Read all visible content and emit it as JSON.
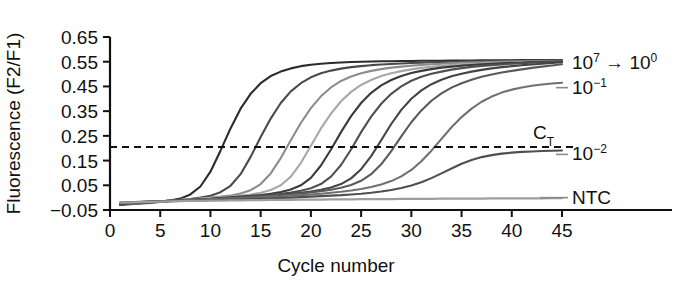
{
  "chart_data": {
    "type": "line",
    "title": "",
    "xlabel": "Cycle number",
    "ylabel": "Fluorescence (F2/F1)",
    "xlim": [
      0,
      45
    ],
    "ylim": [
      -0.05,
      0.65
    ],
    "grid": false,
    "legend_position": "right-inline",
    "x_ticks": [
      "0",
      "5",
      "10",
      "15",
      "20",
      "25",
      "30",
      "35",
      "40",
      "45"
    ],
    "x_tick_values": [
      0,
      5,
      10,
      15,
      20,
      25,
      30,
      35,
      40,
      45
    ],
    "y_ticks": [
      "0.65",
      "0.55",
      "0.45",
      "0.35",
      "0.25",
      "0.15",
      "0.05",
      "−0.05"
    ],
    "y_tick_values": [
      0.65,
      0.55,
      0.45,
      0.35,
      0.25,
      0.15,
      0.05,
      -0.05
    ],
    "threshold": {
      "label": "C",
      "label_sub": "T",
      "value": 0.205,
      "style": "dashed"
    },
    "annotations": [
      {
        "id": "dilution-range",
        "text": "10",
        "sup": "7",
        "arrow": "→",
        "text2": "10",
        "sup2": "0",
        "y": 0.545
      },
      {
        "id": "dilution-1e-1",
        "text": "10",
        "sup": "−1",
        "y": 0.445
      },
      {
        "id": "dilution-1e-2",
        "text": "10",
        "sup": "−2",
        "y": 0.175
      },
      {
        "id": "ntc",
        "text": "NTC",
        "y": 0.0
      }
    ],
    "x": [
      1,
      2,
      3,
      4,
      5,
      6,
      7,
      8,
      9,
      10,
      11,
      12,
      13,
      14,
      15,
      16,
      17,
      18,
      19,
      20,
      21,
      22,
      23,
      24,
      25,
      26,
      27,
      28,
      29,
      30,
      31,
      32,
      33,
      34,
      35,
      36,
      37,
      38,
      39,
      40,
      41,
      42,
      43,
      44,
      45
    ],
    "series": [
      {
        "name": "10^7",
        "color": "#2b2b2b",
        "ct": 10.0,
        "values": [
          -0.03,
          -0.027,
          -0.024,
          -0.021,
          -0.017,
          -0.012,
          -0.004,
          0.013,
          0.045,
          0.105,
          0.19,
          0.28,
          0.36,
          0.42,
          0.463,
          0.492,
          0.51,
          0.523,
          0.532,
          0.538,
          0.542,
          0.545,
          0.547,
          0.549,
          0.55,
          0.551,
          0.552,
          0.552,
          0.553,
          0.553,
          0.554,
          0.554,
          0.554,
          0.555,
          0.555,
          0.555,
          0.556,
          0.556,
          0.556,
          0.556,
          0.557,
          0.557,
          0.557,
          0.557,
          0.557
        ]
      },
      {
        "name": "10^6",
        "color": "#4a4a4a",
        "ct": 13.0,
        "values": [
          -0.028,
          -0.025,
          -0.022,
          -0.019,
          -0.016,
          -0.013,
          -0.01,
          -0.006,
          0.0,
          0.008,
          0.022,
          0.048,
          0.095,
          0.165,
          0.245,
          0.32,
          0.383,
          0.43,
          0.463,
          0.487,
          0.503,
          0.514,
          0.522,
          0.528,
          0.532,
          0.536,
          0.539,
          0.541,
          0.543,
          0.545,
          0.546,
          0.548,
          0.549,
          0.55,
          0.551,
          0.552,
          0.552,
          0.553,
          0.553,
          0.554,
          0.554,
          0.555,
          0.555,
          0.556,
          0.556
        ]
      },
      {
        "name": "10^5",
        "color": "#8c8c8c",
        "ct": 16.5,
        "values": [
          -0.027,
          -0.024,
          -0.021,
          -0.018,
          -0.015,
          -0.012,
          -0.009,
          -0.006,
          -0.003,
          0.0,
          0.004,
          0.009,
          0.017,
          0.03,
          0.055,
          0.098,
          0.16,
          0.232,
          0.302,
          0.362,
          0.41,
          0.446,
          0.472,
          0.49,
          0.503,
          0.513,
          0.52,
          0.526,
          0.53,
          0.534,
          0.537,
          0.54,
          0.542,
          0.544,
          0.546,
          0.547,
          0.548,
          0.549,
          0.55,
          0.551,
          0.552,
          0.552,
          0.553,
          0.553,
          0.554
        ]
      },
      {
        "name": "10^4",
        "color": "#a8a8a8",
        "ct": 20.0,
        "values": [
          -0.026,
          -0.023,
          -0.02,
          -0.018,
          -0.015,
          -0.012,
          -0.01,
          -0.007,
          -0.005,
          -0.002,
          0.001,
          0.004,
          0.008,
          0.013,
          0.02,
          0.031,
          0.05,
          0.085,
          0.14,
          0.21,
          0.28,
          0.34,
          0.39,
          0.428,
          0.456,
          0.476,
          0.492,
          0.503,
          0.512,
          0.519,
          0.525,
          0.529,
          0.533,
          0.536,
          0.539,
          0.541,
          0.543,
          0.545,
          0.546,
          0.548,
          0.549,
          0.55,
          0.551,
          0.552,
          0.553
        ]
      },
      {
        "name": "10^3",
        "color": "#3a3a3a",
        "ct": 23.5,
        "values": [
          -0.025,
          -0.023,
          -0.02,
          -0.018,
          -0.015,
          -0.013,
          -0.011,
          -0.009,
          -0.007,
          -0.005,
          -0.002,
          0.001,
          0.004,
          0.007,
          0.011,
          0.016,
          0.023,
          0.033,
          0.05,
          0.08,
          0.13,
          0.195,
          0.265,
          0.33,
          0.383,
          0.424,
          0.454,
          0.476,
          0.492,
          0.504,
          0.513,
          0.52,
          0.526,
          0.53,
          0.534,
          0.537,
          0.54,
          0.542,
          0.544,
          0.546,
          0.547,
          0.549,
          0.55,
          0.551,
          0.552
        ]
      },
      {
        "name": "10^2",
        "color": "#505050",
        "ct": 26.5,
        "values": [
          -0.024,
          -0.022,
          -0.02,
          -0.018,
          -0.016,
          -0.014,
          -0.012,
          -0.01,
          -0.008,
          -0.006,
          -0.004,
          -0.001,
          0.002,
          0.005,
          0.008,
          0.012,
          0.016,
          0.021,
          0.028,
          0.038,
          0.055,
          0.085,
          0.132,
          0.195,
          0.265,
          0.328,
          0.38,
          0.42,
          0.45,
          0.473,
          0.489,
          0.501,
          0.51,
          0.518,
          0.524,
          0.529,
          0.533,
          0.536,
          0.539,
          0.542,
          0.544,
          0.546,
          0.548,
          0.549,
          0.551
        ]
      },
      {
        "name": "10^1",
        "color": "#444444",
        "ct": 30.0,
        "values": [
          -0.023,
          -0.021,
          -0.019,
          -0.017,
          -0.015,
          -0.013,
          -0.011,
          -0.009,
          -0.008,
          -0.006,
          -0.004,
          -0.002,
          0.0,
          0.003,
          0.006,
          0.009,
          0.012,
          0.016,
          0.02,
          0.025,
          0.032,
          0.041,
          0.055,
          0.078,
          0.115,
          0.168,
          0.232,
          0.298,
          0.355,
          0.4,
          0.434,
          0.459,
          0.477,
          0.491,
          0.501,
          0.51,
          0.517,
          0.523,
          0.528,
          0.532,
          0.536,
          0.539,
          0.542,
          0.545,
          0.548
        ]
      },
      {
        "name": "10^0",
        "color": "#5a5a5a",
        "ct": 33.0,
        "values": [
          -0.022,
          -0.02,
          -0.018,
          -0.016,
          -0.015,
          -0.013,
          -0.011,
          -0.01,
          -0.008,
          -0.006,
          -0.005,
          -0.003,
          -0.001,
          0.001,
          0.004,
          0.007,
          0.01,
          0.013,
          0.017,
          0.021,
          0.026,
          0.032,
          0.04,
          0.051,
          0.068,
          0.095,
          0.135,
          0.188,
          0.248,
          0.305,
          0.353,
          0.392,
          0.422,
          0.445,
          0.463,
          0.477,
          0.489,
          0.498,
          0.506,
          0.513,
          0.519,
          0.525,
          0.53,
          0.535,
          0.54
        ]
      },
      {
        "name": "10^-1",
        "color": "#707070",
        "ct": 38.0,
        "values": [
          -0.021,
          -0.019,
          -0.018,
          -0.016,
          -0.015,
          -0.013,
          -0.012,
          -0.01,
          -0.009,
          -0.007,
          -0.006,
          -0.004,
          -0.003,
          -0.001,
          0.001,
          0.003,
          0.005,
          0.008,
          0.01,
          0.013,
          0.016,
          0.02,
          0.024,
          0.029,
          0.035,
          0.043,
          0.053,
          0.067,
          0.086,
          0.112,
          0.147,
          0.19,
          0.238,
          0.285,
          0.326,
          0.36,
          0.388,
          0.409,
          0.425,
          0.437,
          0.446,
          0.453,
          0.458,
          0.462,
          0.465
        ]
      },
      {
        "name": "10^-2",
        "color": "#4f4f4f",
        "ct": null,
        "values": [
          -0.02,
          -0.019,
          -0.017,
          -0.016,
          -0.015,
          -0.014,
          -0.013,
          -0.012,
          -0.011,
          -0.01,
          -0.009,
          -0.008,
          -0.007,
          -0.005,
          -0.004,
          -0.003,
          -0.001,
          0.0,
          0.002,
          0.004,
          0.006,
          0.008,
          0.01,
          0.013,
          0.016,
          0.02,
          0.025,
          0.031,
          0.039,
          0.049,
          0.062,
          0.079,
          0.098,
          0.118,
          0.137,
          0.152,
          0.164,
          0.172,
          0.178,
          0.182,
          0.185,
          0.187,
          0.189,
          0.19,
          0.191
        ]
      },
      {
        "name": "NTC",
        "color": "#9e9e9e",
        "ct": null,
        "values": [
          -0.02,
          -0.019,
          -0.018,
          -0.017,
          -0.016,
          -0.015,
          -0.014,
          -0.013,
          -0.013,
          -0.012,
          -0.012,
          -0.011,
          -0.011,
          -0.01,
          -0.01,
          -0.009,
          -0.009,
          -0.009,
          -0.008,
          -0.008,
          -0.008,
          -0.007,
          -0.007,
          -0.007,
          -0.006,
          -0.006,
          -0.006,
          -0.006,
          -0.005,
          -0.005,
          -0.005,
          -0.005,
          -0.004,
          -0.004,
          -0.004,
          -0.004,
          -0.004,
          -0.003,
          -0.003,
          -0.003,
          -0.003,
          -0.003,
          -0.003,
          -0.002,
          -0.002
        ]
      }
    ]
  }
}
